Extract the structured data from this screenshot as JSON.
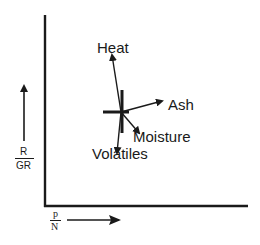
{
  "diagram": {
    "y_axis_label": {
      "numerator": "R",
      "denominator": "GR"
    },
    "x_axis_label": {
      "numerator": "p",
      "denominator": "N"
    },
    "vectors": [
      {
        "name": "heat",
        "label": "Heat"
      },
      {
        "name": "ash",
        "label": "Ash"
      },
      {
        "name": "moisture",
        "label": "Moisture"
      },
      {
        "name": "volatiles",
        "label": "Volatiles"
      }
    ],
    "colors": {
      "ink": "#1a1a1a",
      "background": "#ffffff"
    }
  }
}
